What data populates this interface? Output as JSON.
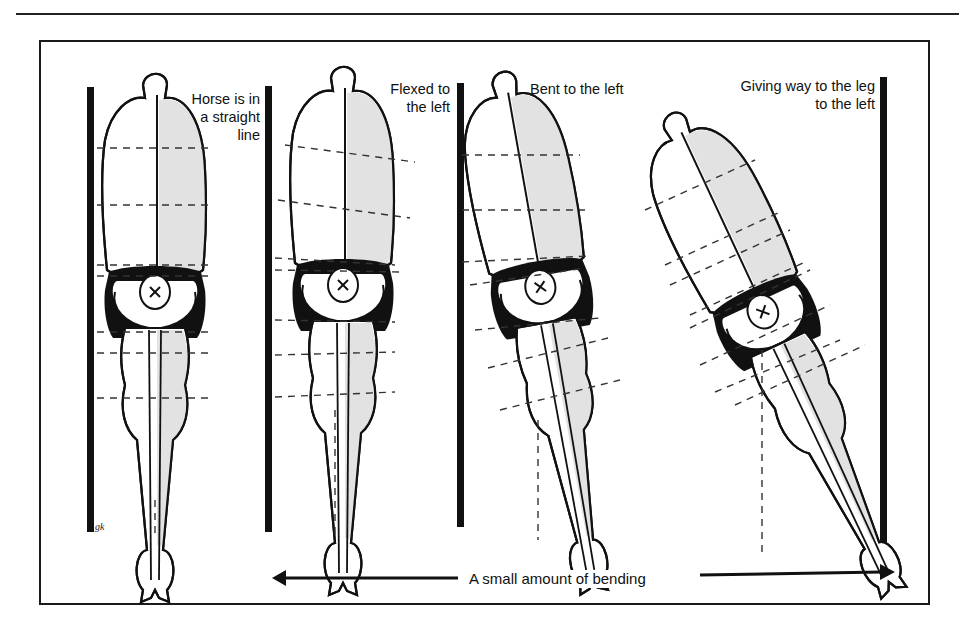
{
  "figure": {
    "panels": [
      {
        "id": "straight",
        "label_lines": [
          "Horse is in",
          "a straight",
          "line"
        ]
      },
      {
        "id": "flexed",
        "label_lines": [
          "Flexed to",
          "the left"
        ]
      },
      {
        "id": "bent",
        "label_lines": [
          "Bent to the left"
        ]
      },
      {
        "id": "giving-way",
        "label_lines": [
          "Giving way to the leg",
          "to the left"
        ]
      }
    ],
    "caption": "A small amount of bending",
    "artist_signature": "gk",
    "colors": {
      "ink": "#111111",
      "shading": "#e4e4e4",
      "background": "#ffffff"
    }
  }
}
